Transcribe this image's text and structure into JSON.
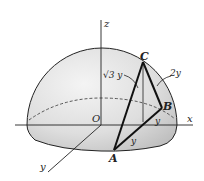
{
  "diagram": {
    "type": "hemisphere-geometry",
    "labels": {
      "z_axis": "z",
      "x_axis": "x",
      "y_axis": "y",
      "origin": "O",
      "point_a": "A",
      "point_b": "B",
      "point_c": "C",
      "edge_ac": "√3 y",
      "edge_bc": "2y",
      "edge_ab": "y",
      "edge_b_foot": "y"
    },
    "colors": {
      "line": "#222222",
      "surface_light": "#f2f2f2",
      "surface_dark": "#c9c9c9",
      "background": "#ffffff"
    }
  }
}
